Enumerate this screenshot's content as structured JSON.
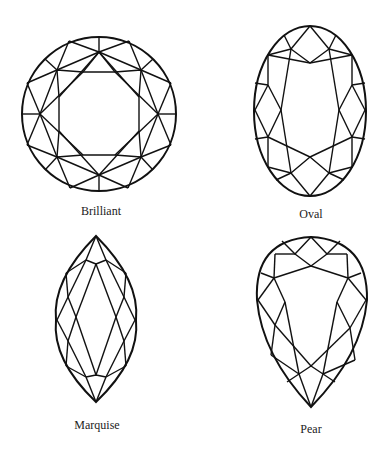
{
  "diagram": {
    "shapes": [
      {
        "id": "brilliant",
        "label": "Brilliant"
      },
      {
        "id": "oval",
        "label": "Oval"
      },
      {
        "id": "marquise",
        "label": "Marquise"
      },
      {
        "id": "pear",
        "label": "Pear"
      }
    ],
    "colors": {
      "line": "#111111",
      "background": "#ffffff",
      "text": "#222222"
    }
  }
}
